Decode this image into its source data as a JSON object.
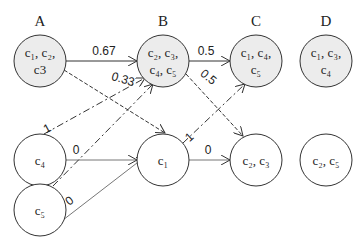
{
  "columns": [
    {
      "id": "A",
      "label": "A",
      "x": 40
    },
    {
      "id": "B",
      "label": "B",
      "x": 163
    },
    {
      "id": "C",
      "label": "C",
      "x": 256
    },
    {
      "id": "D",
      "label": "D",
      "x": 326
    }
  ],
  "nodes": [
    {
      "id": "A",
      "lines": [
        "c₁, c₂,",
        "c3"
      ],
      "x": 40,
      "y": 61,
      "r": 26,
      "fill": "#ececec"
    },
    {
      "id": "B",
      "lines": [
        "c₂, c₃,",
        "c₄, c₅"
      ],
      "x": 163,
      "y": 61,
      "r": 26,
      "fill": "#ececec"
    },
    {
      "id": "C",
      "lines": [
        "c₁, c₄,",
        "c₅"
      ],
      "x": 256,
      "y": 61,
      "r": 26,
      "fill": "#ececec"
    },
    {
      "id": "D",
      "lines": [
        "c₁, c₃,",
        "c₄"
      ],
      "x": 326,
      "y": 61,
      "r": 26,
      "fill": "#ececec"
    },
    {
      "id": "c4",
      "lines": [
        "c₄"
      ],
      "x": 40,
      "y": 160,
      "r": 26,
      "fill": "#ffffff"
    },
    {
      "id": "c1",
      "lines": [
        "c₁"
      ],
      "x": 163,
      "y": 160,
      "r": 26,
      "fill": "#ffffff"
    },
    {
      "id": "c2c3",
      "lines": [
        "c₂, c₃"
      ],
      "x": 256,
      "y": 160,
      "r": 26,
      "fill": "#ffffff"
    },
    {
      "id": "c2c5",
      "lines": [
        "c₂, c₅"
      ],
      "x": 326,
      "y": 160,
      "r": 26,
      "fill": "#ffffff"
    },
    {
      "id": "c5",
      "lines": [
        "c₅"
      ],
      "x": 40,
      "y": 210,
      "r": 26,
      "fill": "#ffffff"
    }
  ],
  "edges": [
    {
      "from": "A",
      "to": "B",
      "label": "0.67",
      "style": "solid"
    },
    {
      "from": "A",
      "to": "c1",
      "label": "0.33",
      "style": "dashed"
    },
    {
      "from": "c4",
      "to": "B",
      "label": "1",
      "style": "dashdot"
    },
    {
      "from": "c4",
      "to": "c1",
      "label": "0",
      "style": "solid"
    },
    {
      "from": "c5",
      "to": "B",
      "label": "1",
      "style": "dashdot"
    },
    {
      "from": "c5",
      "to": "c1",
      "label": "0",
      "style": "solid"
    },
    {
      "from": "B",
      "to": "C",
      "label": "0.5",
      "style": "solid"
    },
    {
      "from": "B",
      "to": "c2c3",
      "label": "0.5",
      "style": "dashed"
    },
    {
      "from": "c1",
      "to": "C",
      "label": "1",
      "style": "dashdot"
    },
    {
      "from": "c1",
      "to": "c2c3",
      "label": "0",
      "style": "solid"
    }
  ],
  "colors": {
    "stroke": "#333333",
    "shaded": "#ececec"
  }
}
